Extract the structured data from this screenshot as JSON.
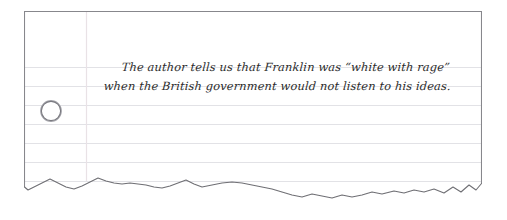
{
  "page": {
    "background_color": "#ffffff"
  },
  "paper": {
    "type": "lined-notebook-paper",
    "fill_color": "#ffffff",
    "border_color": "#808080",
    "torn_edge": "bottom",
    "x": 24,
    "y": 11,
    "width": 458,
    "height": 198,
    "rule_line_color": "#e2e2e6",
    "rule_line_spacing": 19,
    "rule_line_count": 7,
    "margin_line_color": "#e8e0e4",
    "margin_line_x": 86
  },
  "hole_punch": {
    "label": "hole-punch",
    "center_x": 52,
    "center_y": 112,
    "diameter": 21,
    "ring_color": "#6f6f74",
    "shadow_color": "#9a9aa0"
  },
  "note": {
    "line_1": "The author tells us that Franklin was “white with rage”",
    "line_2": "when the British government would not listen to his ideas.",
    "ink_color": "#2b2b2b",
    "style": "handwritten-italic-script"
  }
}
